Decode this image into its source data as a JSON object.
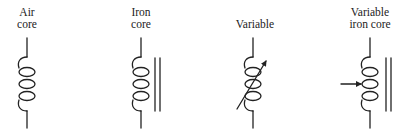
{
  "symbols": [
    {
      "id": "air-core",
      "label_lines": [
        "Air",
        "core"
      ],
      "core": "none",
      "variable": "none"
    },
    {
      "id": "iron-core",
      "label_lines": [
        "Iron",
        "core"
      ],
      "core": "iron",
      "variable": "none"
    },
    {
      "id": "variable",
      "label_lines": [
        "Variable"
      ],
      "core": "none",
      "variable": "diagonal-arrow"
    },
    {
      "id": "variable-iron-core",
      "label_lines": [
        "Variable",
        "iron core"
      ],
      "core": "iron",
      "variable": "side-arrow"
    }
  ],
  "colors": {
    "stroke": "#222222",
    "background": "#ffffff"
  }
}
